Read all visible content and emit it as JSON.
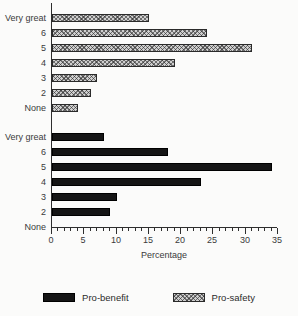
{
  "chart_data": {
    "type": "bar",
    "orientation": "horizontal",
    "title": "",
    "xlabel": "Percentage",
    "xlim": [
      0,
      35
    ],
    "xticks_major": [
      0,
      5,
      10,
      15,
      20,
      25,
      30,
      35
    ],
    "minor_tick_step": 1,
    "grid": false,
    "categories": [
      "Very great",
      "6",
      "5",
      "4",
      "3",
      "2",
      "None"
    ],
    "series": [
      {
        "name": "Pro-safety",
        "style": "hatched",
        "panel": "top",
        "values": [
          15,
          24,
          31,
          19,
          7,
          6,
          4
        ]
      },
      {
        "name": "Pro-benefit",
        "style": "solid",
        "panel": "bottom",
        "values": [
          8,
          18,
          34,
          23,
          10,
          9,
          0
        ]
      }
    ],
    "legend": [
      {
        "label": "Pro-benefit",
        "style": "solid"
      },
      {
        "label": "Pro-safety",
        "style": "hatched"
      }
    ],
    "legend_position": "bottom",
    "colors": {
      "solid_bar": "#151515",
      "hatched_bar_base": "#cfcfcf",
      "hatched_bar_lines": "#2d2d2d",
      "axis": "#2e2e2e",
      "background": "#fbfbfa"
    }
  }
}
